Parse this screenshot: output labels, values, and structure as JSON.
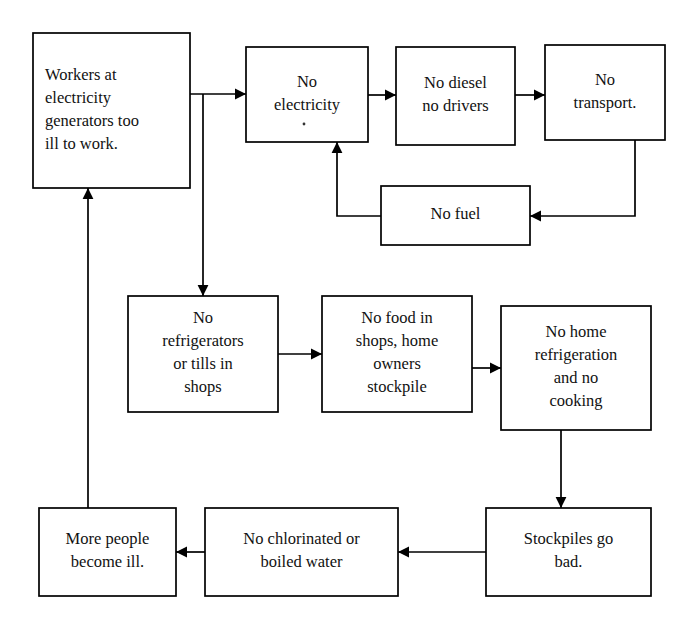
{
  "diagram": {
    "type": "flowchart",
    "nodes": [
      {
        "id": "workers-ill",
        "name": "workers-at-electricity-generators-too-ill-to-work",
        "lines": [
          "Workers at",
          "electricity",
          "generators too",
          "ill  to work."
        ],
        "align": "left",
        "x": 33,
        "y": 33,
        "w": 157,
        "h": 155
      },
      {
        "id": "no-electricity",
        "name": "no-electricity",
        "lines": [
          "No",
          "electricity"
        ],
        "align": "center",
        "x": 246,
        "y": 47,
        "w": 122,
        "h": 95
      },
      {
        "id": "no-diesel",
        "name": "no-diesel-no-drivers",
        "lines": [
          "No diesel",
          "no drivers"
        ],
        "align": "center",
        "x": 396,
        "y": 47,
        "w": 119,
        "h": 98
      },
      {
        "id": "no-transport",
        "name": "no-transport",
        "lines": [
          "No",
          "transport."
        ],
        "align": "center",
        "x": 545,
        "y": 45,
        "w": 120,
        "h": 95
      },
      {
        "id": "no-fuel",
        "name": "no-fuel",
        "lines": [
          "No fuel"
        ],
        "align": "center",
        "x": 381,
        "y": 186,
        "w": 149,
        "h": 59
      },
      {
        "id": "no-refrigerators",
        "name": "no-refrigerators-or-tills-in-shops",
        "lines": [
          "No",
          "refrigerators",
          "or tills in",
          "shops"
        ],
        "align": "center",
        "x": 128,
        "y": 296,
        "w": 150,
        "h": 116
      },
      {
        "id": "no-food",
        "name": "no-food-in-shops-home-owners-stockpile",
        "lines": [
          "No food in",
          "shops, home",
          "owners",
          "stockpile"
        ],
        "align": "center",
        "x": 322,
        "y": 296,
        "w": 150,
        "h": 116
      },
      {
        "id": "no-home-refrigeration",
        "name": "no-home-refrigeration-and-no-cooking",
        "lines": [
          "No home",
          "refrigeration",
          "and no",
          "cooking"
        ],
        "align": "center",
        "x": 501,
        "y": 306,
        "w": 150,
        "h": 124
      },
      {
        "id": "stockpiles-bad",
        "name": "stockpiles-go-bad",
        "lines": [
          "Stockpiles go",
          "bad."
        ],
        "align": "center",
        "x": 486,
        "y": 508,
        "w": 165,
        "h": 88
      },
      {
        "id": "no-clean-water",
        "name": "no-chlorinated-or-boiled-water",
        "lines": [
          "No chlorinated or",
          "boiled water"
        ],
        "align": "center",
        "x": 205,
        "y": 508,
        "w": 193,
        "h": 88
      },
      {
        "id": "more-ill",
        "name": "more-people-become-ill",
        "lines": [
          "More people",
          "become ill."
        ],
        "align": "center",
        "x": 39,
        "y": 508,
        "w": 137,
        "h": 88
      }
    ],
    "edges": [
      {
        "id": "e1",
        "name": "edge-workers-to-no-electricity",
        "from": "workers-ill",
        "to": "no-electricity",
        "points": "190,94 246,94",
        "arrow": "right",
        "arrow_at": "246,94"
      },
      {
        "id": "e2",
        "name": "edge-workers-branch-to-no-refrigerators",
        "from": "workers-ill",
        "to": "no-refrigerators",
        "points": "203,94 203,296",
        "arrow": "down",
        "arrow_at": "203,296"
      },
      {
        "id": "e3",
        "name": "edge-no-electricity-to-no-diesel",
        "from": "no-electricity",
        "to": "no-diesel",
        "points": "368,95 396,95",
        "arrow": "right",
        "arrow_at": "396,95"
      },
      {
        "id": "e4",
        "name": "edge-no-diesel-to-no-transport",
        "from": "no-diesel",
        "to": "no-transport",
        "points": "515,95 545,95",
        "arrow": "right",
        "arrow_at": "545,95"
      },
      {
        "id": "e5",
        "name": "edge-no-transport-to-no-fuel",
        "from": "no-transport",
        "to": "no-fuel",
        "points": "635,140 635,216 530,216",
        "arrow": "left",
        "arrow_at": "530,216"
      },
      {
        "id": "e6",
        "name": "edge-no-fuel-to-no-electricity",
        "from": "no-fuel",
        "to": "no-electricity",
        "points": "381,216 337,216 337,142",
        "arrow": "up",
        "arrow_at": "337,142"
      },
      {
        "id": "e7",
        "name": "edge-no-refrigerators-to-no-food",
        "from": "no-refrigerators",
        "to": "no-food",
        "points": "278,354 322,354",
        "arrow": "right",
        "arrow_at": "322,354"
      },
      {
        "id": "e8",
        "name": "edge-no-food-to-no-home-refrigeration",
        "from": "no-food",
        "to": "no-home-refrigeration",
        "points": "472,368 501,368",
        "arrow": "right",
        "arrow_at": "501,368"
      },
      {
        "id": "e9",
        "name": "edge-no-home-refrigeration-to-stockpiles-bad",
        "from": "no-home-refrigeration",
        "to": "stockpiles-bad",
        "points": "561,430 561,508",
        "arrow": "down",
        "arrow_at": "561,508"
      },
      {
        "id": "e10",
        "name": "edge-stockpiles-bad-to-no-clean-water",
        "from": "stockpiles-bad",
        "to": "no-clean-water",
        "points": "486,552 398,552",
        "arrow": "left",
        "arrow_at": "398,552"
      },
      {
        "id": "e11",
        "name": "edge-no-clean-water-to-more-ill",
        "from": "no-clean-water",
        "to": "more-ill",
        "points": "205,552 176,552",
        "arrow": "left",
        "arrow_at": "176,552"
      },
      {
        "id": "e12",
        "name": "edge-more-ill-to-workers-ill",
        "from": "more-ill",
        "to": "workers-ill",
        "points": "88,508 88,188",
        "arrow": "up",
        "arrow_at": "88,188"
      }
    ],
    "marks": [
      {
        "id": "m1",
        "name": "stray-speck",
        "x": 304,
        "y": 124,
        "r": 1.4
      }
    ]
  }
}
